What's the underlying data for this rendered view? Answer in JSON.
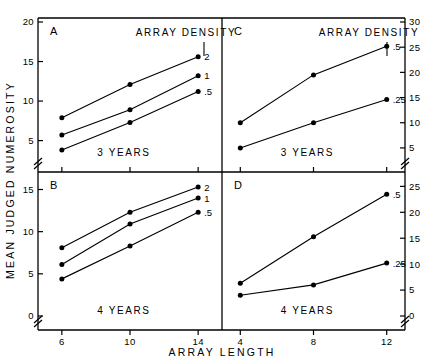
{
  "figure": {
    "axis_titles": {
      "y": "MEAN JUDGED NUMEROSITY",
      "x": "ARRAY LENGTH"
    },
    "annotations": {
      "array_density": "ARRAY DENSITY",
      "three_years": "3 YEARS",
      "four_years": "4 YEARS"
    },
    "colors": {
      "ink": "#000000",
      "background": "#ffffff"
    }
  },
  "chart_data": [
    {
      "type": "line",
      "panel": "A",
      "title": "A",
      "group_label": "3 YEARS",
      "legend_title": "ARRAY DENSITY",
      "legend_position": "right-of-lines",
      "xlabel": "ARRAY LENGTH",
      "ylabel": "MEAN JUDGED NUMEROSITY",
      "x": [
        6,
        10,
        14
      ],
      "xticks": [
        "6",
        "10",
        "14"
      ],
      "xlim": [
        4.6,
        15.4
      ],
      "yticks": [
        "5",
        "10",
        "15",
        "20"
      ],
      "ylim": [
        2.8,
        20
      ],
      "axis_break": true,
      "grid": false,
      "series": [
        {
          "name": "2",
          "label": "2",
          "values": [
            7.9,
            12.1,
            15.6
          ]
        },
        {
          "name": "1",
          "label": "1",
          "values": [
            5.7,
            8.9,
            13.2
          ]
        },
        {
          "name": ".5",
          "label": ".5",
          "values": [
            3.8,
            7.3,
            11.2
          ]
        }
      ]
    },
    {
      "type": "line",
      "panel": "C",
      "title": "C",
      "group_label": "3 YEARS",
      "legend_title": "ARRAY DENSITY",
      "legend_position": "right-of-lines",
      "xlabel": "ARRAY LENGTH",
      "ylabel": "MEAN JUDGED NUMEROSITY",
      "x": [
        4,
        8,
        12
      ],
      "xticks": [
        "4",
        "8",
        "12"
      ],
      "xlim": [
        3.0,
        13.0
      ],
      "yticks": [
        "5",
        "10",
        "15",
        "20",
        "25",
        "30"
      ],
      "ylim": [
        3.0,
        30
      ],
      "axis_break": true,
      "grid": false,
      "series": [
        {
          "name": ".5",
          "label": ".5",
          "values": [
            10.0,
            19.5,
            25.2
          ]
        },
        {
          "name": ".25",
          "label": ".25",
          "values": [
            5.0,
            10.0,
            14.6
          ]
        }
      ]
    },
    {
      "type": "line",
      "panel": "B",
      "title": "B",
      "group_label": "4 YEARS",
      "legend_position": "right-of-lines",
      "xlabel": "ARRAY LENGTH",
      "ylabel": "MEAN JUDGED NUMEROSITY",
      "x": [
        6,
        10,
        14
      ],
      "xticks": [
        "6",
        "10",
        "14"
      ],
      "xlim": [
        4.6,
        15.4
      ],
      "yticks": [
        "0",
        "5",
        "10",
        "15"
      ],
      "ylim": [
        0,
        16.6
      ],
      "axis_break": true,
      "grid": false,
      "series": [
        {
          "name": "2",
          "label": "2",
          "values": [
            8.1,
            12.3,
            15.3
          ]
        },
        {
          "name": "1",
          "label": "1",
          "values": [
            6.1,
            10.9,
            14.0
          ]
        },
        {
          "name": ".5",
          "label": ".5",
          "values": [
            4.4,
            8.3,
            12.3
          ]
        }
      ]
    },
    {
      "type": "line",
      "panel": "D",
      "title": "D",
      "group_label": "4 YEARS",
      "legend_position": "right-of-lines",
      "xlabel": "ARRAY LENGTH",
      "ylabel": "MEAN JUDGED NUMEROSITY",
      "x": [
        4,
        8,
        12
      ],
      "xticks": [
        "4",
        "8",
        "12"
      ],
      "xlim": [
        3.0,
        13.0
      ],
      "yticks": [
        "0",
        "5",
        "10",
        "15",
        "20",
        "25"
      ],
      "ylim": [
        0,
        27.0
      ],
      "axis_break": true,
      "grid": false,
      "series": [
        {
          "name": ".5",
          "label": ".5",
          "values": [
            6.3,
            15.3,
            23.5
          ]
        },
        {
          "name": ".25",
          "label": ".25",
          "values": [
            4.0,
            6.0,
            10.2
          ]
        }
      ]
    }
  ]
}
